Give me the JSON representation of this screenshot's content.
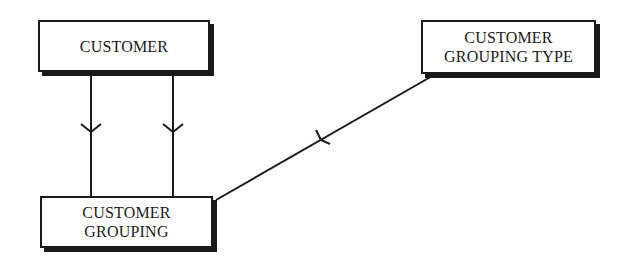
{
  "diagram": {
    "type": "entity-relationship",
    "notation": "crow's foot",
    "entities": [
      {
        "id": "customer",
        "label_lines": [
          "CUSTOMER"
        ]
      },
      {
        "id": "customer-grouping-type",
        "label_lines": [
          "CUSTOMER",
          "GROUPING TYPE"
        ]
      },
      {
        "id": "customer-grouping",
        "label_lines": [
          "CUSTOMER",
          "GROUPING"
        ]
      }
    ],
    "relationships": [
      {
        "from": "customer",
        "to": "customer-grouping",
        "cardinality_mark": "crow's foot (many) pointing toward customer-grouping"
      },
      {
        "from": "customer",
        "to": "customer-grouping",
        "cardinality_mark": "crow's foot (many) pointing toward customer-grouping"
      },
      {
        "from": "customer-grouping-type",
        "to": "customer-grouping",
        "cardinality_mark": "crow's foot (many) pointing toward customer-grouping"
      }
    ],
    "colors": {
      "stroke": "#1a1a1a",
      "background": "#ffffff"
    }
  }
}
